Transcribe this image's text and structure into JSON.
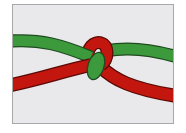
{
  "diagram": {
    "title": "Knot joining two ropes",
    "ropes": [
      {
        "name": "green-rope",
        "color": "#3c9a3c",
        "outline": "#1f4a1f"
      },
      {
        "name": "red-rope",
        "color": "#c2160f",
        "outline": "#5a0a06"
      }
    ],
    "background": "#e9e9eb",
    "border": "#a8a8a8"
  }
}
